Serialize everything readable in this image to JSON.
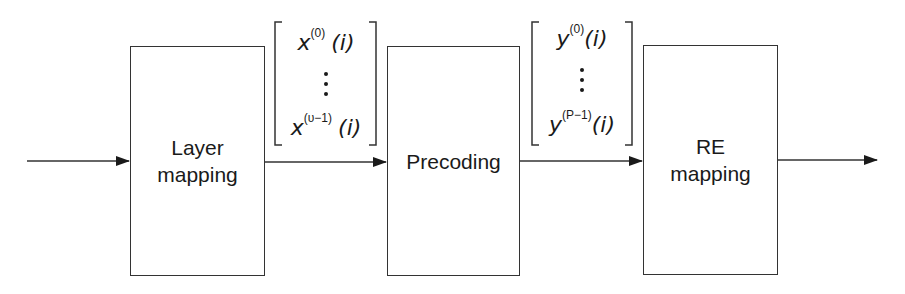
{
  "diagram": {
    "type": "block-diagram",
    "blocks": [
      {
        "id": "layer-mapping",
        "label_line1": "Layer",
        "label_line2": "mapping"
      },
      {
        "id": "precoding",
        "label_line1": "Precoding",
        "label_line2": ""
      },
      {
        "id": "re-mapping",
        "label_line1": "RE",
        "label_line2": "mapping"
      }
    ],
    "vectors": [
      {
        "id": "x-vector",
        "top": {
          "sym": "x",
          "sup": "(0)",
          "arg": "(i)"
        },
        "dots": "⋮",
        "bottom": {
          "sym": "x",
          "sup": "(υ−1)",
          "arg": "(i)"
        }
      },
      {
        "id": "y-vector",
        "top": {
          "sym": "y",
          "sup": "(0)",
          "arg": "(i)"
        },
        "dots": "⋮",
        "bottom": {
          "sym": "y",
          "sup": "(P−1)",
          "arg": "(i)"
        }
      }
    ],
    "edges": [
      {
        "from": "input",
        "to": "layer-mapping"
      },
      {
        "from": "layer-mapping",
        "to": "precoding"
      },
      {
        "from": "precoding",
        "to": "re-mapping"
      },
      {
        "from": "re-mapping",
        "to": "output"
      }
    ],
    "colors": {
      "stroke": "#333333",
      "text": "#1a1a1a",
      "background": "#ffffff"
    }
  }
}
